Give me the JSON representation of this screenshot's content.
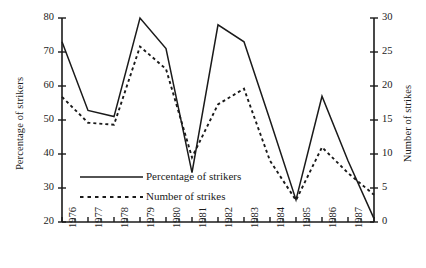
{
  "chart_data": {
    "type": "line",
    "title": "",
    "xlabel": "",
    "ylabel": "Percentage of strikers",
    "y2label": "Number of strikes",
    "categories": [
      "1976",
      "1977",
      "1978",
      "1979",
      "1980",
      "1981",
      "1982",
      "1983",
      "1984",
      "1985",
      "1986",
      "1987",
      "1988"
    ],
    "x_tick_labels": [
      "1976",
      "1977",
      "1978",
      "1979",
      "1980",
      "1981",
      "1982",
      "1983",
      "1984",
      "1985",
      "1986",
      "1987"
    ],
    "ylim": [
      20,
      80
    ],
    "y_ticks": [
      20,
      30,
      40,
      50,
      60,
      70,
      80
    ],
    "y2lim": [
      0,
      30
    ],
    "y2_ticks": [
      0,
      5,
      10,
      15,
      20,
      25,
      30
    ],
    "grid": false,
    "legend_position": "lower-left-inside",
    "series": [
      {
        "name": "Percentage of strikers",
        "axis": "left",
        "style": "solid",
        "color": "#1a1a1a",
        "values": [
          73.0,
          52.8,
          51.0,
          80.0,
          71.0,
          34.5,
          78.0,
          73.0,
          50.0,
          26.5,
          57.0,
          38.0,
          21.0
        ]
      },
      {
        "name": "Number of strikes",
        "axis": "right",
        "style": "dotted",
        "color": "#1a1a1a",
        "values": [
          18.4,
          14.6,
          14.3,
          25.8,
          22.5,
          9.5,
          17.3,
          19.6,
          9.0,
          3.2,
          11.0,
          7.2,
          4.0
        ]
      }
    ]
  },
  "legend": {
    "items": [
      {
        "label": "Percentage of strikers",
        "style": "solid"
      },
      {
        "label": "Number of strikes",
        "style": "dotted"
      }
    ]
  }
}
